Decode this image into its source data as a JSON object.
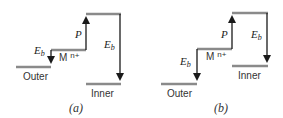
{
  "colors": {
    "level": "#8a8a8a",
    "arrow": "#1a1a1a"
  },
  "panels": [
    {
      "caption": "(a)",
      "outer_label": "Outer",
      "inner_label": "Inner",
      "ion_label": "M",
      "ion_charge": "n+",
      "p_label": "P",
      "eb_label_1": "E",
      "eb_sub_1": "b",
      "eb_label_2": "E",
      "eb_sub_2": "b"
    },
    {
      "caption": "(b)",
      "outer_label": "Outer",
      "inner_label": "Inner",
      "ion_label": "M",
      "ion_charge": "n+",
      "p_label": "P",
      "eb_label_1": "E",
      "eb_sub_1": "b",
      "eb_label_2": "E",
      "eb_sub_2": "b"
    }
  ]
}
